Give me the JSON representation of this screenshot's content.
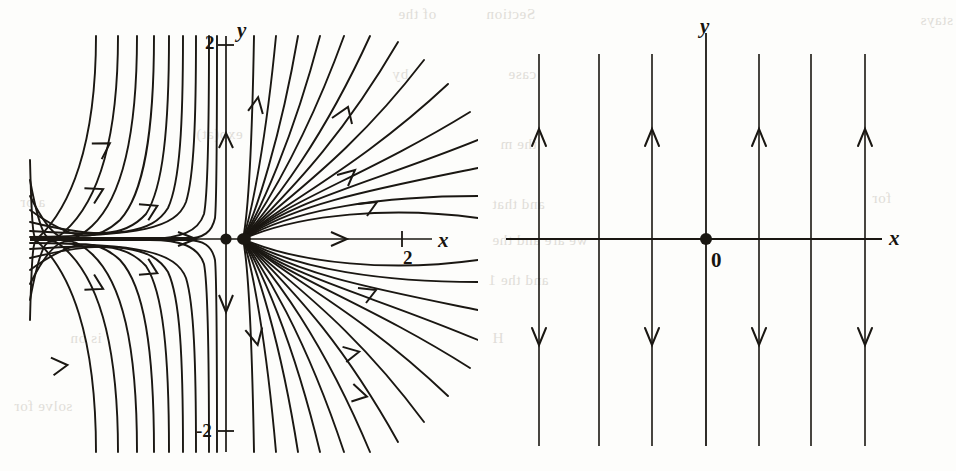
{
  "figure": {
    "kind": "phase-portrait-pair",
    "background_color": "#fdfdfb",
    "ink_color": "#1a1712"
  },
  "ghost": {
    "items": [
      {
        "text": "of the",
        "x": 398,
        "y": 6
      },
      {
        "text": "by",
        "x": 392,
        "y": 66
      },
      {
        "text": "a pr",
        "x": 20,
        "y": 194
      },
      {
        "text": "is on",
        "x": 70,
        "y": 330
      },
      {
        "text": "solve for",
        "x": 14,
        "y": 398
      },
      {
        "text": "exp(at)",
        "x": 196,
        "y": 126
      },
      {
        "text": "Section",
        "x": 486,
        "y": 6
      },
      {
        "text": "stays",
        "x": 920,
        "y": 12
      },
      {
        "text": "case",
        "x": 508,
        "y": 66
      },
      {
        "text": "the m",
        "x": 500,
        "y": 136
      },
      {
        "text": "and that",
        "x": 492,
        "y": 196
      },
      {
        "text": "we are and the",
        "x": 492,
        "y": 232
      },
      {
        "text": "and the 1",
        "x": 488,
        "y": 272
      },
      {
        "text": "H",
        "x": 492,
        "y": 330
      },
      {
        "text": "for",
        "x": 872,
        "y": 190
      }
    ]
  },
  "left_panel": {
    "name": "phase-portrait-saddle-node",
    "axis_labels": [
      {
        "id": "x-axis-label",
        "text": "x",
        "x": 438,
        "y": 228
      },
      {
        "id": "y-axis-label",
        "text": "y",
        "x": 237,
        "y": 18
      }
    ],
    "tick_labels": [
      {
        "id": "y-tick-2",
        "text": "2",
        "x": 205,
        "y": 32
      },
      {
        "id": "y-tick-minus-2",
        "text": "-2",
        "x": 196,
        "y": 420
      },
      {
        "id": "x-tick-2",
        "text": "2",
        "x": 403,
        "y": 247
      }
    ]
  },
  "right_panel": {
    "name": "phase-portrait-vertical-flow",
    "axis_labels": [
      {
        "id": "x-axis-label",
        "text": "x",
        "x": 411,
        "y": 226
      },
      {
        "id": "y-axis-label",
        "text": "y",
        "x": 222,
        "y": 14
      }
    ],
    "origin_label": {
      "id": "origin-label",
      "text": "0",
      "x": 233,
      "y": 248
    }
  },
  "chart_data": {
    "type": "scatter",
    "title": "",
    "panels": [
      {
        "name": "left",
        "description": "Phase portrait of a degenerate/improper node at the origin. Trajectories approach the equilibrium along the negative x direction and leave along the positive x direction; the y-axis acts as a separatrix with flow toward the origin from above and away below.",
        "xlabel": "x",
        "ylabel": "y",
        "xlim": [
          -3.6,
          3.1
        ],
        "ylim": [
          -2.6,
          2.3
        ],
        "x_ticks": [
          2
        ],
        "y_ticks": [
          2,
          -2
        ],
        "grid": false,
        "equilibrium_points": [
          {
            "x": 0,
            "y": 0,
            "label": ""
          }
        ],
        "axis_origin_px": {
          "x": 226,
          "y": 239
        },
        "scale_px_per_unit": {
          "x": 88,
          "y": 97
        },
        "arrow_count": 12
      },
      {
        "name": "right",
        "description": "Direction field of vertical straight-line trajectories: flow is upward above the x-axis and downward below it, identical for every x.",
        "xlabel": "x",
        "ylabel": "y",
        "x_ticks": [],
        "y_ticks": [],
        "grid": false,
        "origin_label": "0",
        "equilibrium_points": [
          {
            "x": 0,
            "y": 0,
            "label": "0"
          }
        ],
        "vertical_lines_px_x": [
          61,
          121,
          174,
          228,
          281,
          333,
          387
        ],
        "x_axis_px_y": 239,
        "up_arrow_lines": [
          1,
          3,
          5,
          7
        ],
        "down_arrow_lines": [
          1,
          3,
          5,
          7
        ],
        "up_arrow_px_y": 132,
        "down_arrow_px_y": 343
      }
    ]
  }
}
